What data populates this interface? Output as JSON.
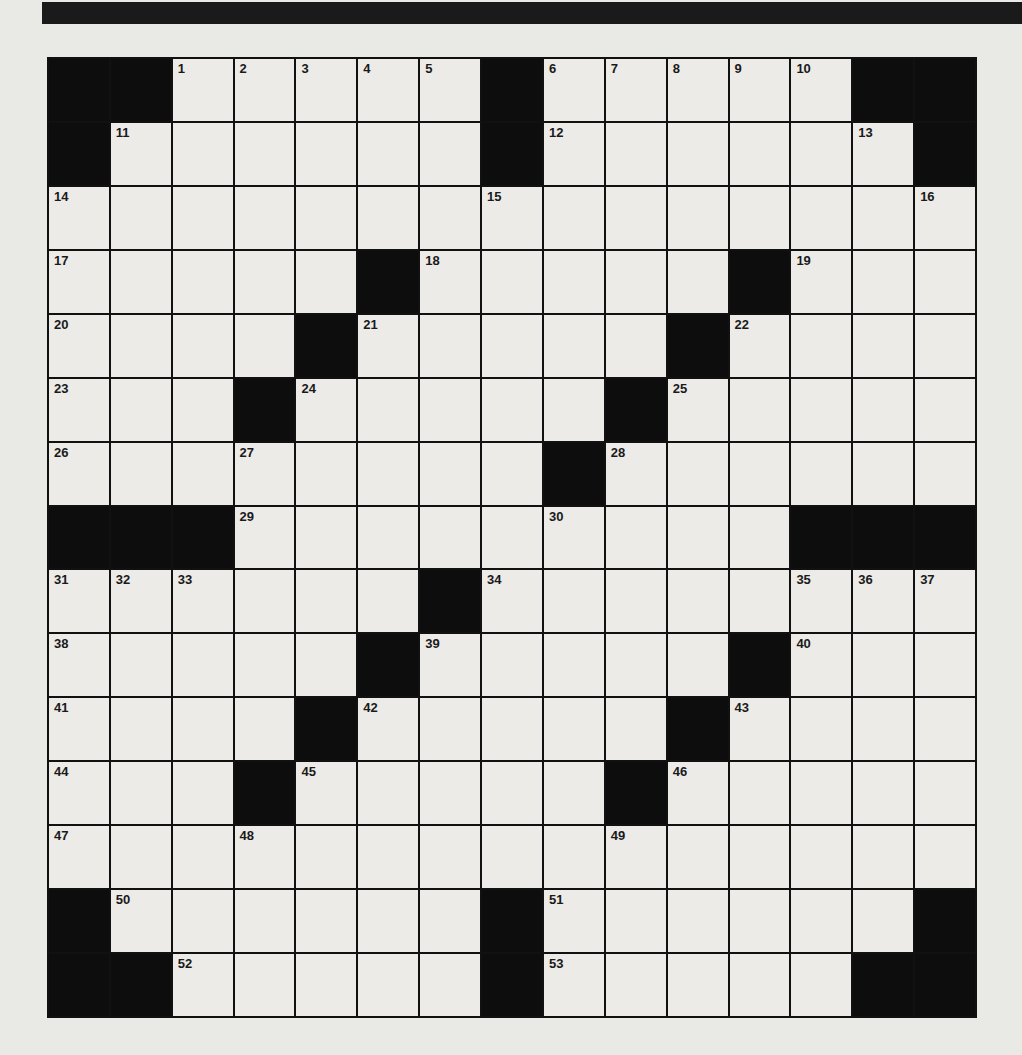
{
  "puzzle": {
    "type": "crossword",
    "rows": 15,
    "cols": 15,
    "colors": {
      "block": "#0d0d0d",
      "cell": "#ecebe8",
      "paper": "#e9e9e6",
      "bar": "#1a1a1a"
    },
    "grid": [
      [
        "#",
        "#",
        "1",
        "2",
        "3",
        "4",
        "5",
        "#",
        "6",
        "7",
        "8",
        "9",
        "10",
        "#",
        "#"
      ],
      [
        "#",
        "11",
        ".",
        ".",
        ".",
        ".",
        ".",
        "#",
        "12",
        ".",
        ".",
        ".",
        ".",
        "13",
        "#"
      ],
      [
        "14",
        ".",
        ".",
        ".",
        ".",
        ".",
        ".",
        "15",
        ".",
        ".",
        ".",
        ".",
        ".",
        ".",
        "16"
      ],
      [
        "17",
        ".",
        ".",
        ".",
        ".",
        "#",
        "18",
        ".",
        ".",
        ".",
        ".",
        "#",
        "19",
        ".",
        "."
      ],
      [
        "20",
        ".",
        ".",
        ".",
        "#",
        "21",
        ".",
        ".",
        ".",
        ".",
        "#",
        "22",
        ".",
        ".",
        "."
      ],
      [
        "23",
        ".",
        ".",
        "#",
        "24",
        ".",
        ".",
        ".",
        ".",
        "#",
        "25",
        ".",
        ".",
        ".",
        "."
      ],
      [
        "26",
        ".",
        ".",
        "27",
        ".",
        ".",
        ".",
        ".",
        "#",
        "28",
        ".",
        ".",
        ".",
        ".",
        "."
      ],
      [
        "#",
        "#",
        "#",
        "29",
        ".",
        ".",
        ".",
        ".",
        "30",
        ".",
        ".",
        ".",
        "#",
        "#",
        "#"
      ],
      [
        "31",
        "32",
        "33",
        ".",
        ".",
        ".",
        "#",
        "34",
        ".",
        ".",
        ".",
        ".",
        "35",
        "36",
        "37"
      ],
      [
        "38",
        ".",
        ".",
        ".",
        ".",
        "#",
        "39",
        ".",
        ".",
        ".",
        ".",
        "#",
        "40",
        ".",
        "."
      ],
      [
        "41",
        ".",
        ".",
        ".",
        "#",
        "42",
        ".",
        ".",
        ".",
        ".",
        "#",
        "43",
        ".",
        ".",
        "."
      ],
      [
        "44",
        ".",
        ".",
        "#",
        "45",
        ".",
        ".",
        ".",
        ".",
        "#",
        "46",
        ".",
        ".",
        ".",
        "."
      ],
      [
        "47",
        ".",
        ".",
        "48",
        ".",
        ".",
        ".",
        ".",
        ".",
        "49",
        ".",
        ".",
        ".",
        ".",
        "."
      ],
      [
        "#",
        "50",
        ".",
        ".",
        ".",
        ".",
        ".",
        "#",
        "51",
        ".",
        ".",
        ".",
        ".",
        ".",
        "#"
      ],
      [
        "#",
        "#",
        "52",
        ".",
        ".",
        ".",
        ".",
        "#",
        "53",
        ".",
        ".",
        ".",
        ".",
        "#",
        "#"
      ]
    ]
  }
}
